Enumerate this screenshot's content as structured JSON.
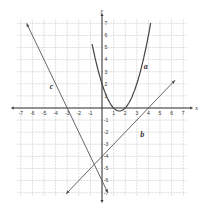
{
  "chart_data": {
    "type": "line",
    "title": "",
    "xlabel": "x",
    "ylabel": "y",
    "xlim": [
      -7,
      7
    ],
    "ylim": [
      -7,
      7
    ],
    "grid": true,
    "x_ticks": [
      "-7",
      "-6",
      "-5",
      "-4",
      "-3",
      "-2",
      "-1",
      "1",
      "2",
      "3",
      "4",
      "5",
      "6",
      "7"
    ],
    "y_ticks": [
      "7",
      "6",
      "5",
      "4",
      "3",
      "2",
      "1",
      "-1",
      "-2",
      "-3",
      "-4",
      "-5",
      "-6",
      "-7"
    ],
    "series": [
      {
        "name": "a",
        "kind": "parabola",
        "equation": "y = x^2 - 3x + 2",
        "points": [
          [
            -0.8,
            5.04
          ],
          [
            0,
            2
          ],
          [
            1,
            0
          ],
          [
            1.5,
            -0.25
          ],
          [
            2,
            0
          ],
          [
            3,
            2
          ],
          [
            4.2,
            7.04
          ]
        ]
      },
      {
        "name": "b",
        "kind": "line",
        "equation": "y = x - 4",
        "points": [
          [
            -3,
            -7
          ],
          [
            0,
            -4
          ],
          [
            4,
            0
          ],
          [
            6.5,
            2.5
          ]
        ]
      },
      {
        "name": "c",
        "kind": "line",
        "equation": "y = -2x - 6",
        "points": [
          [
            -6.5,
            7
          ],
          [
            -3,
            0
          ],
          [
            0,
            -6
          ],
          [
            0.5,
            -7
          ]
        ]
      }
    ],
    "labels": {
      "a": "a",
      "b": "b",
      "c": "c"
    }
  },
  "axes": {
    "x_label": "x",
    "y_label": "y"
  },
  "colors": {
    "grid": "#c8c8c8",
    "axis": "#333333",
    "curve": "#444444"
  }
}
